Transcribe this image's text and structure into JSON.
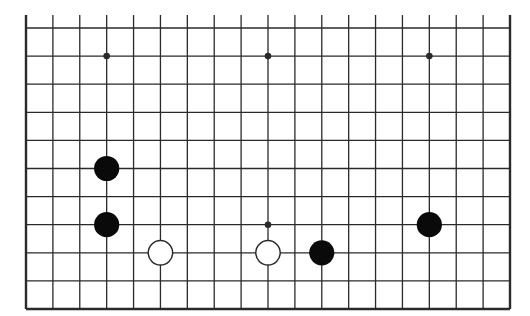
{
  "board": {
    "size": 19,
    "visible_columns": 19,
    "visible_rows_from_bottom": 11,
    "edges": {
      "left": true,
      "right": true,
      "bottom": true,
      "top": false
    },
    "colors": {
      "background": "#ffffff",
      "line": "#2a2a2a",
      "black_stone": "#0a0a0a",
      "white_stone": "#ffffff",
      "white_stone_outline": "#2a2a2a"
    },
    "star_points": [
      {
        "col": 4,
        "row": 10
      },
      {
        "col": 10,
        "row": 10
      },
      {
        "col": 16,
        "row": 10
      },
      {
        "col": 4,
        "row": 4
      },
      {
        "col": 10,
        "row": 4
      },
      {
        "col": 16,
        "row": 4
      }
    ],
    "stones": [
      {
        "color": "black",
        "col": 4,
        "row": 6
      },
      {
        "color": "black",
        "col": 4,
        "row": 4
      },
      {
        "color": "white",
        "col": 6,
        "row": 3
      },
      {
        "color": "white",
        "col": 10,
        "row": 3
      },
      {
        "color": "black",
        "col": 12,
        "row": 3
      },
      {
        "color": "black",
        "col": 16,
        "row": 4
      }
    ]
  }
}
